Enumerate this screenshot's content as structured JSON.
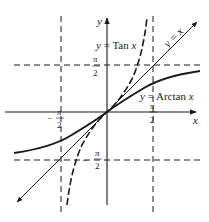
{
  "diagram": {
    "axes": {
      "x_label": "x",
      "y_label": "y"
    },
    "tick_labels": {
      "x_pos": {
        "num": "π",
        "den": "2"
      },
      "x_neg": {
        "sign": "−",
        "num": "π",
        "den": "2"
      },
      "y_pos": {
        "num": "π",
        "den": "2"
      },
      "y_neg": {
        "sign": "−",
        "num": "π",
        "den": "2"
      }
    },
    "curves": [
      {
        "id": "tan",
        "label_prefix": "y = ",
        "label_func": "Tan",
        "label_var": " x",
        "style": "dashed"
      },
      {
        "id": "arctan",
        "label_prefix": "y = ",
        "label_func": "Arctan",
        "label_var": " x",
        "style": "solid"
      },
      {
        "id": "identity",
        "label": "y = x",
        "style": "solid-arrow"
      }
    ],
    "asymptotes": [
      {
        "orientation": "vertical",
        "at": "π/2"
      },
      {
        "orientation": "vertical",
        "at": "−π/2"
      },
      {
        "orientation": "horizontal",
        "at": "π/2"
      },
      {
        "orientation": "horizontal",
        "at": "−π/2"
      }
    ],
    "colors": {
      "ink": "#1a1a1a",
      "background": "#ffffff"
    }
  }
}
